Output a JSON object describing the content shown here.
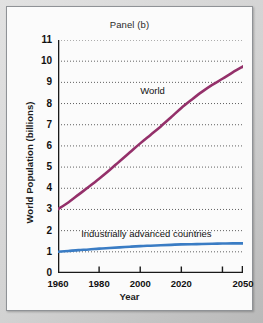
{
  "figure": {
    "title": "Panel (b)",
    "background_color": "#fbfbfb",
    "frame_color": "#8f9296"
  },
  "chart_data": {
    "type": "line",
    "title": "Panel (b)",
    "xlabel": "Year",
    "ylabel": "World Population (billions)",
    "xlim": [
      1960,
      2050
    ],
    "ylim": [
      0,
      11
    ],
    "grid": "horizontal-dotted",
    "legend": "inline-annotations",
    "ytick_labels": [
      "0",
      "1",
      "2",
      "3",
      "4",
      "5",
      "6",
      "7",
      "8",
      "9",
      "10",
      "11"
    ],
    "ytick_values": [
      0,
      1,
      2,
      3,
      4,
      5,
      6,
      7,
      8,
      9,
      10,
      11
    ],
    "xtick_labels": [
      "1960",
      "1980",
      "2000",
      "2020",
      "2050"
    ],
    "xtick_values": [
      1960,
      1980,
      2000,
      2020,
      2050
    ],
    "x": [
      1960,
      1965,
      1970,
      1975,
      1980,
      1985,
      1990,
      1995,
      2000,
      2005,
      2010,
      2015,
      2020,
      2025,
      2030,
      2035,
      2040,
      2045,
      2050
    ],
    "series": [
      {
        "name": "World",
        "color": "#94306a",
        "values": [
          3.02,
          3.33,
          3.7,
          4.07,
          4.45,
          4.85,
          5.28,
          5.7,
          6.12,
          6.52,
          6.92,
          7.35,
          7.79,
          8.18,
          8.55,
          8.88,
          9.17,
          9.47,
          9.75
        ]
      },
      {
        "name": "Industrially advanced countries",
        "color": "#3a7cc4",
        "values": [
          1.0,
          1.04,
          1.08,
          1.11,
          1.15,
          1.18,
          1.21,
          1.24,
          1.27,
          1.29,
          1.31,
          1.33,
          1.35,
          1.36,
          1.37,
          1.38,
          1.39,
          1.4,
          1.4
        ]
      }
    ],
    "annotations": [
      {
        "text": "World",
        "x": 2006,
        "y": 8.6
      },
      {
        "text": "Industrially advanced countries",
        "x": 2003,
        "y": 1.85
      }
    ]
  }
}
